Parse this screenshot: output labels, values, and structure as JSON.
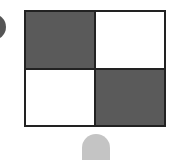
{
  "figure": {
    "cells": [
      {
        "position": "top-left",
        "color": "#5a5a5a"
      },
      {
        "position": "top-right",
        "color": "#ffffff"
      },
      {
        "position": "bottom-left",
        "color": "#ffffff"
      },
      {
        "position": "bottom-right",
        "color": "#5a5a5a"
      }
    ],
    "border_color": "#222222"
  },
  "decorations": {
    "left_blob_color": "#555555",
    "bottom_tab_color": "#c4c4c4"
  }
}
